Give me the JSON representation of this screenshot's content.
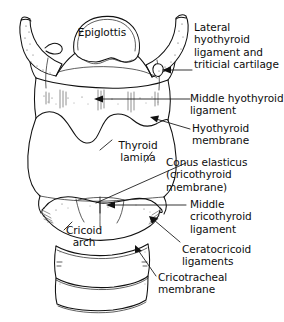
{
  "figure": {
    "view": "anterior",
    "background_color": "#ffffff",
    "line_color": "#111111",
    "text_color": "#0d0d0d"
  },
  "labels": {
    "epiglottis": "Epiglottis",
    "lateral_hyothyroid": "Lateral\nhyothyroid\nligament and\ntriticial cartilage",
    "middle_hyothyroid": "Middle hyothyroid\nligament",
    "hyothyroid_membrane": "Hyothyroid\nmembrane",
    "thyroid_lamina": "Thyroid\nlamina",
    "conus_elasticus": "Conus elasticus\n(cricothyroid\nmembrane)",
    "middle_cricothyroid": "Middle\ncricothyroid\nligament",
    "cricoid_arch": "Cricoid\narch",
    "ceratocricoid": "Ceratocricoid\nligaments",
    "cricotracheal": "Cricotracheal\nmembrane"
  },
  "structures": [
    {
      "name": "epiglottis",
      "region": "superior-midline"
    },
    {
      "name": "hyoid-bone",
      "region": "superior"
    },
    {
      "name": "greater-horn-left",
      "region": "superior-left"
    },
    {
      "name": "greater-horn-right",
      "region": "superior-right"
    },
    {
      "name": "hyothyroid-membrane",
      "region": "upper-middle"
    },
    {
      "name": "thyroid-cartilage-lamina",
      "region": "middle"
    },
    {
      "name": "cricothyroid-ligament",
      "region": "lower-middle"
    },
    {
      "name": "cricoid-cartilage-arch",
      "region": "lower"
    },
    {
      "name": "tracheal-ring-first",
      "region": "inferior"
    },
    {
      "name": "tracheal-ring-second",
      "region": "inferior"
    }
  ]
}
